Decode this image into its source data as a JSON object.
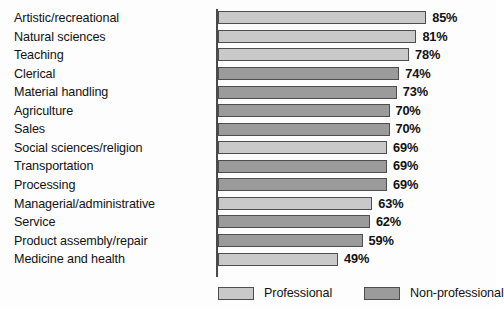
{
  "chart_data": {
    "type": "bar",
    "orientation": "horizontal",
    "title": "",
    "subtitle": "",
    "xlabel": "",
    "ylabel": "",
    "xlim": [
      0,
      100
    ],
    "grid": false,
    "legend_position": "bottom",
    "value_suffix": "%",
    "categories": [
      "Artistic/recreational",
      "Natural sciences",
      "Teaching",
      "Clerical",
      "Material handling",
      "Agriculture",
      "Sales",
      "Social sciences/religion",
      "Transportation",
      "Processing",
      "Managerial/administrative",
      "Service",
      "Product assembly/repair",
      "Medicine and health"
    ],
    "values": [
      85,
      81,
      78,
      74,
      73,
      70,
      70,
      69,
      69,
      69,
      63,
      62,
      59,
      49
    ],
    "value_labels": [
      "85%",
      "81%",
      "78%",
      "74%",
      "73%",
      "70%",
      "70%",
      "69%",
      "69%",
      "69%",
      "63%",
      "62%",
      "59%",
      "49%"
    ],
    "groups": [
      "Professional",
      "Professional",
      "Professional",
      "Non-professional",
      "Non-professional",
      "Non-professional",
      "Non-professional",
      "Professional",
      "Non-professional",
      "Non-professional",
      "Professional",
      "Non-professional",
      "Non-professional",
      "Professional"
    ],
    "legend": [
      {
        "label": "Professional",
        "color": "#c9c9c9",
        "key": "professional"
      },
      {
        "label": "Non-professional",
        "color": "#9b9b9b",
        "key": "nonprofessional"
      }
    ],
    "colors": {
      "professional": "#c9c9c9",
      "nonprofessional": "#9b9b9b",
      "bar_border": "#4e4e4e",
      "axis": "#4a4a4a",
      "text": "#121212",
      "background": "#fdfdfd"
    }
  }
}
